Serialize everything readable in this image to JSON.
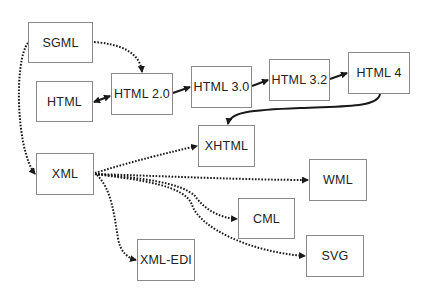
{
  "diagram": {
    "nodes": [
      {
        "id": "sgml",
        "label": "SGML",
        "x": 28,
        "y": 22,
        "w": 65,
        "h": 41
      },
      {
        "id": "html",
        "label": "HTML",
        "x": 36,
        "y": 81,
        "w": 57,
        "h": 41
      },
      {
        "id": "html20",
        "label": "HTML 2.0",
        "x": 111,
        "y": 73,
        "w": 62,
        "h": 42
      },
      {
        "id": "html30",
        "label": "HTML 3.0",
        "x": 191,
        "y": 66,
        "w": 61,
        "h": 42
      },
      {
        "id": "html32",
        "label": "HTML 3.2",
        "x": 269,
        "y": 59,
        "w": 61,
        "h": 42
      },
      {
        "id": "html4",
        "label": "HTML 4",
        "x": 348,
        "y": 52,
        "w": 62,
        "h": 42
      },
      {
        "id": "xhtml",
        "label": "XHTML",
        "x": 198,
        "y": 125,
        "w": 57,
        "h": 42
      },
      {
        "id": "xml",
        "label": "XML",
        "x": 36,
        "y": 153,
        "w": 58,
        "h": 42
      },
      {
        "id": "wml",
        "label": "WML",
        "x": 309,
        "y": 159,
        "w": 58,
        "h": 42
      },
      {
        "id": "cml",
        "label": "CML",
        "x": 238,
        "y": 198,
        "w": 57,
        "h": 41
      },
      {
        "id": "svg",
        "label": "SVG",
        "x": 306,
        "y": 235,
        "w": 58,
        "h": 42
      },
      {
        "id": "xmledi",
        "label": "XML-EDI",
        "x": 137,
        "y": 239,
        "w": 58,
        "h": 42
      }
    ],
    "edges": [
      {
        "from": "sgml",
        "to": "html20",
        "style": "dotted"
      },
      {
        "from": "sgml",
        "to": "xml",
        "style": "dotted"
      },
      {
        "from": "html",
        "to": "html20",
        "style": "solid",
        "bidirectional": true
      },
      {
        "from": "html20",
        "to": "html30",
        "style": "solid"
      },
      {
        "from": "html30",
        "to": "html32",
        "style": "solid"
      },
      {
        "from": "html32",
        "to": "html4",
        "style": "solid"
      },
      {
        "from": "html4",
        "to": "xhtml",
        "style": "solid"
      },
      {
        "from": "xml",
        "to": "xhtml",
        "style": "dotted"
      },
      {
        "from": "xml",
        "to": "wml",
        "style": "dotted"
      },
      {
        "from": "xml",
        "to": "cml",
        "style": "dotted"
      },
      {
        "from": "xml",
        "to": "svg",
        "style": "dotted"
      },
      {
        "from": "xml",
        "to": "xmledi",
        "style": "dotted"
      }
    ],
    "colors": {
      "line": "#1a1a1a",
      "border": "#8a8a8a",
      "text": "#222222"
    }
  }
}
